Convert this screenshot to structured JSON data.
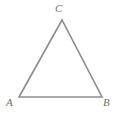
{
  "figure": {
    "kind": "geometry-diagram",
    "background_color": "#ffffff",
    "stroke_color": "#8c8c8c",
    "stroke_width": 1.6,
    "label_color": "#6e6e6e",
    "vertices": [
      {
        "id": "A",
        "label": "A",
        "x": 19,
        "y": 97
      },
      {
        "id": "B",
        "label": "B",
        "x": 102,
        "y": 97
      },
      {
        "id": "C",
        "label": "C",
        "x": 62,
        "y": 20
      }
    ],
    "edges": [
      {
        "id": "AB",
        "from": "A",
        "to": "B"
      },
      {
        "id": "BC",
        "from": "B",
        "to": "C"
      },
      {
        "id": "CA",
        "from": "C",
        "to": "A"
      }
    ],
    "polygon_points": "19,97 62,20 102,97"
  }
}
